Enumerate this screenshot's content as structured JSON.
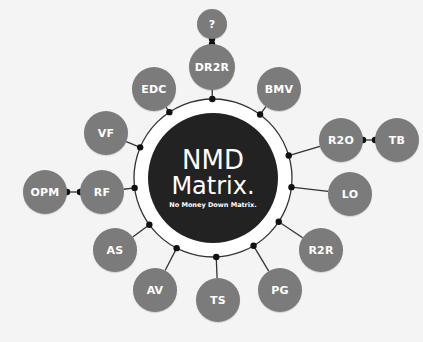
{
  "diagram": {
    "title": "NMD",
    "title_line2": "Matrix.",
    "subtitle": "No Money Down Matrix.",
    "colors": {
      "background": "#f4f4f4",
      "center": "#222222",
      "node": "#7b7b7b",
      "ring": "#ffffff",
      "line": "#333333"
    },
    "nodes": [
      {
        "id": "q",
        "label": "?",
        "cx": 212,
        "cy": 24,
        "r": 15,
        "parent": "dr2r"
      },
      {
        "id": "dr2r",
        "label": "DR2R",
        "cx": 212,
        "cy": 67,
        "r": 23
      },
      {
        "id": "edc",
        "label": "EDC",
        "cx": 154,
        "cy": 89,
        "r": 22
      },
      {
        "id": "bmv",
        "label": "BMV",
        "cx": 279,
        "cy": 89,
        "r": 22
      },
      {
        "id": "vf",
        "label": "VF",
        "cx": 106,
        "cy": 133,
        "r": 22
      },
      {
        "id": "r2o",
        "label": "R2O",
        "cx": 341,
        "cy": 140,
        "r": 22
      },
      {
        "id": "tb",
        "label": "TB",
        "cx": 397,
        "cy": 140,
        "r": 22,
        "parent": "r2o"
      },
      {
        "id": "opm",
        "label": "OPM",
        "cx": 45,
        "cy": 192,
        "r": 22,
        "parent": "rf"
      },
      {
        "id": "rf",
        "label": "RF",
        "cx": 102,
        "cy": 192,
        "r": 22
      },
      {
        "id": "lo",
        "label": "LO",
        "cx": 350,
        "cy": 194,
        "r": 22
      },
      {
        "id": "as",
        "label": "AS",
        "cx": 115,
        "cy": 250,
        "r": 22
      },
      {
        "id": "r2r",
        "label": "R2R",
        "cx": 321,
        "cy": 250,
        "r": 22
      },
      {
        "id": "av",
        "label": "AV",
        "cx": 155,
        "cy": 290,
        "r": 22
      },
      {
        "id": "pg",
        "label": "PG",
        "cx": 280,
        "cy": 290,
        "r": 22
      },
      {
        "id": "ts",
        "label": "TS",
        "cx": 218,
        "cy": 300,
        "r": 22
      }
    ]
  }
}
